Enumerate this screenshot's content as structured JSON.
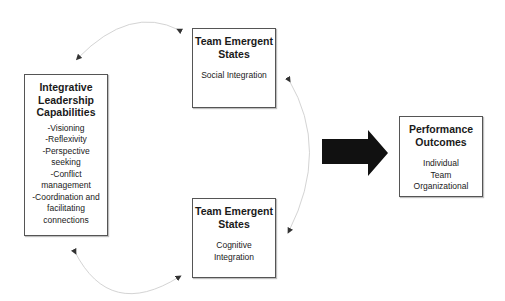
{
  "leadership": {
    "title_lines": [
      "Integrative",
      "Leadership",
      "Capabilities"
    ],
    "items": [
      "-Visioning",
      "-Reflexivity",
      "-Perspective",
      "seeking",
      "-Conflict",
      "management",
      "-Coordination and",
      "facilitating",
      "connections"
    ]
  },
  "social": {
    "title_lines": [
      "Team Emergent",
      "States"
    ],
    "items": [
      "Social Integration"
    ]
  },
  "cognitive": {
    "title_lines": [
      "Team Emergent",
      "States"
    ],
    "items": [
      "Cognitive",
      "Integration"
    ]
  },
  "performance": {
    "title_lines": [
      "Performance",
      "Outcomes"
    ],
    "items": [
      "Individual",
      "Team",
      "Organizational"
    ]
  },
  "colors": {
    "border": "#555555",
    "arrow": "#111111",
    "connector": "#cfcfcf"
  }
}
